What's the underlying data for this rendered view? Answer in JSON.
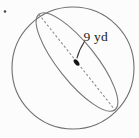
{
  "figure": {
    "label": "9 yd",
    "shape": "sphere-with-great-circle"
  },
  "colors": {
    "outline": "#6f6f6f",
    "ellipse": "#747474",
    "dashed": "#8c8c8c",
    "leader": "#3a3a3a",
    "dot": "#141414",
    "text": "#1b1b1b",
    "stray": "#4a4a4a"
  }
}
